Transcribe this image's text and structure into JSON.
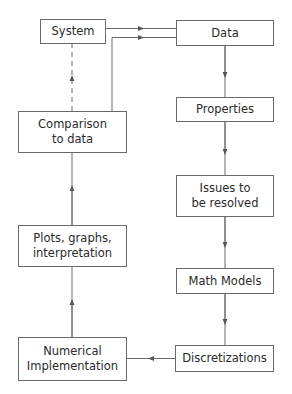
{
  "diagram": {
    "type": "flowchart",
    "nodes": {
      "system": {
        "label": "System"
      },
      "data": {
        "label": "Data"
      },
      "properties": {
        "label": "Properties"
      },
      "issues": {
        "label": "Issues to\nbe resolved"
      },
      "math_models": {
        "label": "Math Models"
      },
      "discretizations": {
        "label": "Discretizations"
      },
      "numerical": {
        "label": "Numerical\nImplementation"
      },
      "plots": {
        "label": "Plots, graphs,\ninterpretation"
      },
      "comparison": {
        "label": "Comparison\nto data"
      }
    },
    "edges": [
      {
        "from": "system",
        "to": "data",
        "style": "solid"
      },
      {
        "from": "comparison",
        "to": "data",
        "style": "solid"
      },
      {
        "from": "data",
        "to": "properties",
        "style": "solid"
      },
      {
        "from": "properties",
        "to": "issues",
        "style": "solid"
      },
      {
        "from": "issues",
        "to": "math_models",
        "style": "solid"
      },
      {
        "from": "math_models",
        "to": "discretizations",
        "style": "solid"
      },
      {
        "from": "discretizations",
        "to": "numerical",
        "style": "solid"
      },
      {
        "from": "numerical",
        "to": "plots",
        "style": "solid"
      },
      {
        "from": "plots",
        "to": "comparison",
        "style": "solid"
      },
      {
        "from": "comparison",
        "to": "system",
        "style": "dashed"
      }
    ],
    "colors": {
      "line": "#6a6a6a",
      "text": "#2a2a2a",
      "background": "#ffffff"
    }
  }
}
